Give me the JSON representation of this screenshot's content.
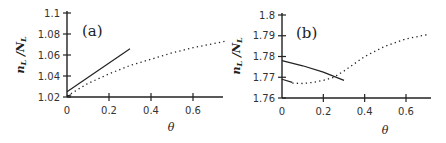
{
  "chart_data": [
    {
      "type": "line",
      "panel_label": "(a)",
      "xlabel": "θ",
      "ylabel": "n_L/N_L",
      "xlim": [
        0,
        0.75
      ],
      "ylim": [
        1.02,
        1.1
      ],
      "xticks": [
        "0",
        "0.2",
        "0.4",
        "0.6"
      ],
      "yticks": [
        "1.02",
        "1.04",
        "1.06",
        "1.08",
        "1.1"
      ],
      "grid": false,
      "series": [
        {
          "name": "solid",
          "style": "solid",
          "x": [
            0,
            0.3
          ],
          "y": [
            1.025,
            1.066
          ]
        },
        {
          "name": "solid-short",
          "style": "solid",
          "x": [
            0,
            0.02
          ],
          "y": [
            1.021,
            1.022
          ]
        },
        {
          "name": "dotted",
          "style": "dotted",
          "x": [
            0,
            0.1,
            0.2,
            0.3,
            0.4,
            0.5,
            0.6,
            0.7,
            0.75
          ],
          "y": [
            1.021,
            1.033,
            1.042,
            1.05,
            1.056,
            1.062,
            1.067,
            1.071,
            1.073
          ]
        }
      ]
    },
    {
      "type": "line",
      "panel_label": "(b)",
      "xlabel": "θ",
      "ylabel": "n_L/N_L",
      "xlim": [
        0,
        0.72
      ],
      "ylim": [
        1.76,
        1.8
      ],
      "xticks": [
        "0",
        "0.2",
        "0.4",
        "0.6"
      ],
      "yticks": [
        "1.76",
        "1.77",
        "1.78",
        "1.79",
        "1.8"
      ],
      "grid": false,
      "series": [
        {
          "name": "solid-upper",
          "style": "solid",
          "x": [
            0,
            0.1,
            0.2,
            0.3
          ],
          "y": [
            1.778,
            1.7755,
            1.7725,
            1.7685
          ]
        },
        {
          "name": "solid-lower",
          "style": "solid",
          "x": [
            0,
            0.05
          ],
          "y": [
            1.769,
            1.7675
          ]
        },
        {
          "name": "dotted",
          "style": "dotted",
          "x": [
            0.05,
            0.1,
            0.15,
            0.2,
            0.25,
            0.3,
            0.4,
            0.5,
            0.6,
            0.7
          ],
          "y": [
            1.7672,
            1.767,
            1.7675,
            1.7685,
            1.77,
            1.773,
            1.78,
            1.785,
            1.7885,
            1.7905
          ]
        }
      ]
    }
  ]
}
